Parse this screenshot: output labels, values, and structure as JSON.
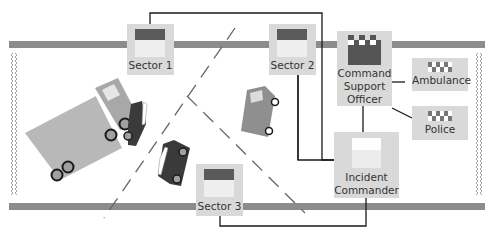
{
  "diagram": {
    "nodes": {
      "sector1": {
        "label": "Sector 1"
      },
      "sector2": {
        "label": "Sector 2"
      },
      "sector3": {
        "label": "Sector 3"
      },
      "command_support_officer": {
        "label_lines": [
          "Command",
          "Support",
          "Officer"
        ]
      },
      "ambulance": {
        "label": "Ambulance"
      },
      "police": {
        "label": "Police"
      },
      "incident_commander": {
        "label_lines": [
          "Incident",
          "Commander"
        ]
      }
    },
    "connections": [
      {
        "from": "Sector 1",
        "to": "Incident Commander"
      },
      {
        "from": "Sector 2",
        "to": "Incident Commander"
      },
      {
        "from": "Sector 3",
        "to": "Incident Commander"
      },
      {
        "from": "Command Support Officer",
        "to": "Incident Commander"
      },
      {
        "from": "Command Support Officer",
        "to": "Ambulance"
      },
      {
        "from": "Command Support Officer",
        "to": "Police"
      }
    ],
    "scene": {
      "vehicles": [
        "lorry",
        "car-crushed",
        "car-small",
        "van"
      ],
      "roads": [
        "top-road",
        "bottom-road"
      ],
      "cordons": [
        "left-cordon",
        "right-cordon"
      ]
    },
    "colors": {
      "road": "#8c8c8c",
      "box": "#d9d9d9",
      "icon_dark": "#555555",
      "lorry": "#b8b8b8",
      "van": "#8f8f8f",
      "car": "#3a3a3a",
      "line": "#1a1a1a"
    }
  }
}
